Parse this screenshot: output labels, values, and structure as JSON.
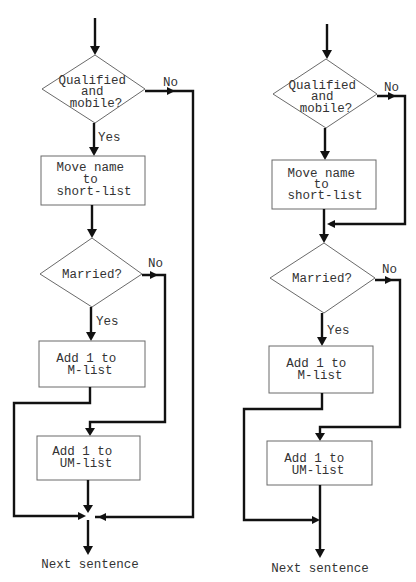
{
  "diagrams": [
    {
      "id": "left",
      "decision1": {
        "lines": [
          "Qualified",
          "and",
          "mobile?"
        ],
        "yes_label": "Yes",
        "no_label": "No"
      },
      "process1": {
        "lines": [
          "Move name",
          "to",
          "short-list"
        ]
      },
      "decision2": {
        "lines": [
          "Married?"
        ],
        "yes_label": "Yes",
        "no_label": "No"
      },
      "process2": {
        "lines": [
          "Add 1 to",
          "M-list"
        ]
      },
      "process3": {
        "lines": [
          "Add 1 to",
          "UM-list"
        ]
      },
      "exit_label": "Next sentence"
    },
    {
      "id": "right",
      "decision1": {
        "lines": [
          "Qualified",
          "and",
          "mobile?"
        ],
        "no_label": "No"
      },
      "process1": {
        "lines": [
          "Move name",
          "to",
          "short-list"
        ]
      },
      "decision2": {
        "lines": [
          "Married?"
        ],
        "yes_label": "Yes",
        "no_label": "No"
      },
      "process2": {
        "lines": [
          "Add 1 to",
          "M-list"
        ]
      },
      "process3": {
        "lines": [
          "Add 1 to",
          "UM-list"
        ]
      },
      "exit_label": "Next sentence"
    }
  ],
  "colors": {
    "line": "#111111",
    "box_border": "#6a6a6a",
    "text": "#333333",
    "background": "#ffffff"
  }
}
